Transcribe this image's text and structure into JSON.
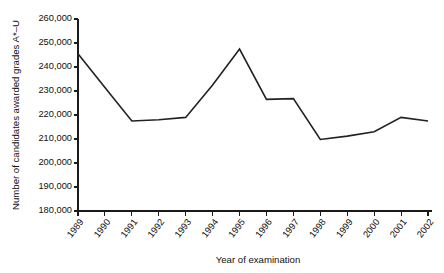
{
  "chart_data": {
    "type": "line",
    "title": "",
    "xlabel": "Year of examination",
    "ylabel": "Number of candidates awarded grades A*–U",
    "categories": [
      "1989",
      "1990",
      "1991",
      "1992",
      "1993",
      "1994",
      "1995",
      "1996",
      "1997",
      "1998",
      "1999",
      "2000",
      "2001",
      "2002"
    ],
    "values": [
      245500,
      231500,
      217500,
      218000,
      219000,
      232500,
      247500,
      226500,
      226800,
      209800,
      211200,
      213000,
      219000,
      217500
    ],
    "series": [
      {
        "name": "Candidates awarded grades A*–U",
        "values": [
          245500,
          231500,
          217500,
          218000,
          219000,
          232500,
          247500,
          226500,
          226800,
          209800,
          211200,
          213000,
          219000,
          217500
        ]
      }
    ],
    "ylim": [
      180000,
      260000
    ],
    "ytick_step": 10000,
    "ytick_labels": [
      "180,000",
      "190,000",
      "200,000",
      "210,000",
      "220,000",
      "230,000",
      "240,000",
      "250,000",
      "260,000"
    ],
    "ytick_values": [
      180000,
      190000,
      200000,
      210000,
      220000,
      230000,
      240000,
      250000,
      260000
    ],
    "grid": false,
    "legend": "none",
    "line_color": "#222222"
  }
}
